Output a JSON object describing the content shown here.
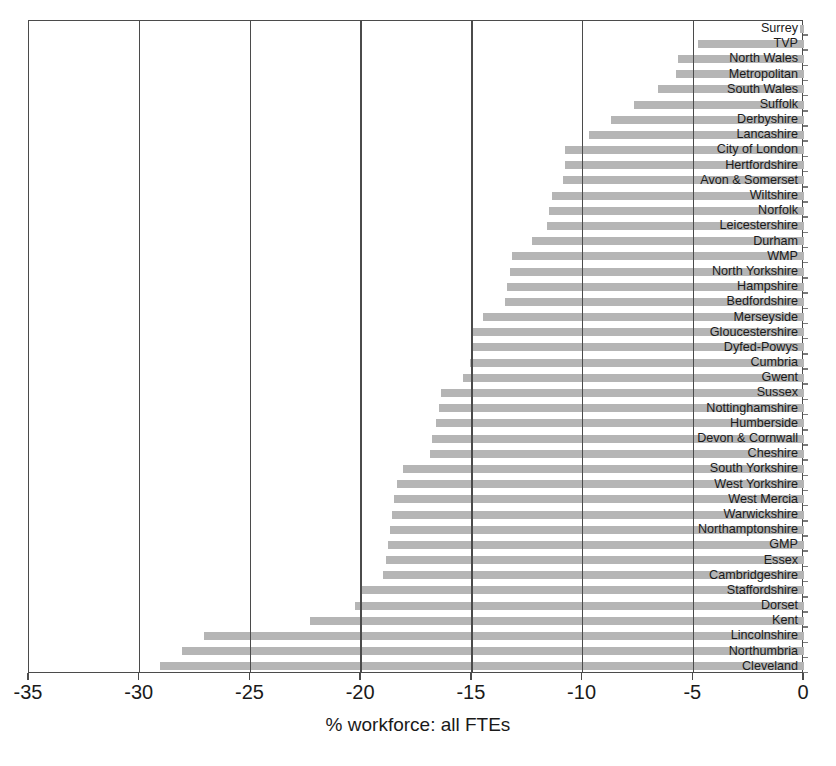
{
  "chart_data": {
    "type": "bar",
    "orientation": "horizontal",
    "title": "",
    "subtitle": "",
    "xlabel": "% workforce: all FTEs",
    "ylabel": "",
    "xlim": [
      -35,
      0
    ],
    "ylim": null,
    "grid": true,
    "legend": null,
    "bar_color": "#b5b5b5",
    "axis_color": "#4b4b4b",
    "xticks": [
      -35,
      -30,
      -25,
      -20,
      -15,
      -10,
      -5,
      0
    ],
    "xticklabels": [
      "-35",
      "-30",
      "-25",
      "-20",
      "-15",
      "-10",
      "-5",
      "0"
    ],
    "categories": [
      "Surrey",
      "TVP",
      "North Wales",
      "Metropolitan",
      "South Wales",
      "Suffolk",
      "Derbyshire",
      "Lancashire",
      "City of London",
      "Hertfordshire",
      "Avon & Somerset",
      "Wiltshire",
      "Norfolk",
      "Leicestershire",
      "Durham",
      "WMP",
      "North Yorkshire",
      "Hampshire",
      "Bedfordshire",
      "Merseyside",
      "Gloucestershire",
      "Dyfed-Powys",
      "Cumbria",
      "Gwent",
      "Sussex",
      "Nottinghamshire",
      "Humberside",
      "Devon & Cornwall",
      "Cheshire",
      "South Yorkshire",
      "West Yorkshire",
      "West Mercia",
      "Warwickshire",
      "Northamptonshire",
      "GMP",
      "Essex",
      "Cambridgeshire",
      "Staffordshire",
      "Dorset",
      "Kent",
      "Lincolnshire",
      "Northumbria",
      "Cleveland"
    ],
    "values": [
      -0.2,
      -4.8,
      -5.7,
      -5.8,
      -6.6,
      -7.7,
      -8.7,
      -9.7,
      -10.8,
      -10.8,
      -10.9,
      -11.4,
      -11.5,
      -11.6,
      -12.3,
      -13.2,
      -13.3,
      -13.4,
      -13.5,
      -14.5,
      -15.0,
      -15.0,
      -15.1,
      -15.4,
      -16.4,
      -16.5,
      -16.6,
      -16.8,
      -16.9,
      -18.1,
      -18.4,
      -18.5,
      -18.6,
      -18.7,
      -18.8,
      -18.9,
      -19.0,
      -20.0,
      -20.3,
      -22.3,
      -27.1,
      -28.1,
      -29.1
    ]
  }
}
